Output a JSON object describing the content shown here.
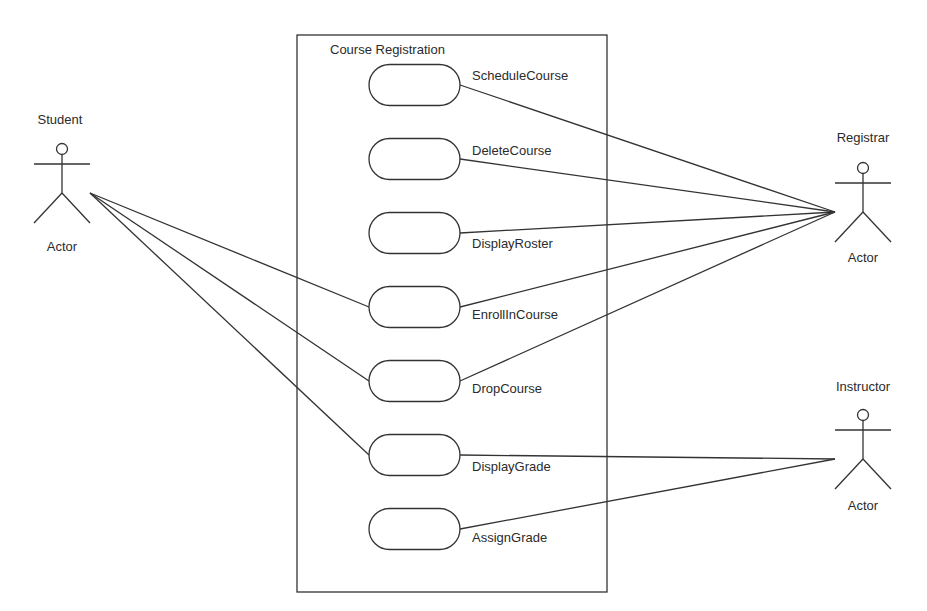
{
  "system": {
    "title": "Course Registration",
    "box": {
      "x": 297,
      "y": 35,
      "w": 310,
      "h": 557
    }
  },
  "use_cases": [
    {
      "id": "schedule",
      "label": "ScheduleCourse",
      "cy": 85,
      "label_pos": "above"
    },
    {
      "id": "delete",
      "label": "DeleteCourse",
      "cy": 159,
      "label_pos": "above"
    },
    {
      "id": "roster",
      "label": "DisplayRoster",
      "cy": 233,
      "label_pos": "below"
    },
    {
      "id": "enroll",
      "label": "EnrollInCourse",
      "cy": 307,
      "label_pos": "below"
    },
    {
      "id": "drop",
      "label": "DropCourse",
      "cy": 381,
      "label_pos": "below"
    },
    {
      "id": "displaygrade",
      "label": "DisplayGrade",
      "cy": 455,
      "label_pos": "below"
    },
    {
      "id": "assigngrade",
      "label": "AssignGrade",
      "cy": 529,
      "label_pos": "below"
    }
  ],
  "actors": [
    {
      "id": "student",
      "name": "Student",
      "stereotype": "Actor",
      "cx": 62,
      "head_y": 149,
      "connects": [
        "enroll",
        "drop",
        "displaygrade"
      ],
      "side": "left"
    },
    {
      "id": "registrar",
      "name": "Registrar",
      "stereotype": "Actor",
      "cx": 863,
      "head_y": 168,
      "connects": [
        "schedule",
        "delete",
        "roster",
        "enroll",
        "drop"
      ],
      "side": "right"
    },
    {
      "id": "instructor",
      "name": "Instructor",
      "stereotype": "Actor",
      "cx": 863,
      "head_y": 415,
      "connects": [
        "displaygrade",
        "assigngrade"
      ],
      "side": "right"
    }
  ],
  "colors": {
    "stroke": "#333333",
    "text": "#2b2b2b",
    "background": "#ffffff"
  }
}
